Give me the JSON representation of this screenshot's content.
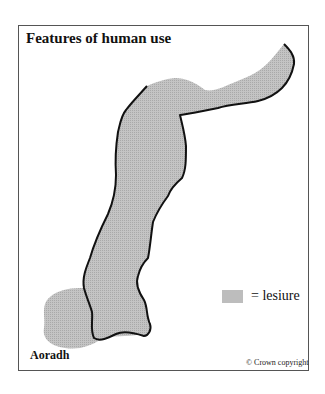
{
  "title": "Features of human use",
  "legend": {
    "symbol": "=",
    "label": "lesiure",
    "swatch_color": "#bdbdbd"
  },
  "place_label": "Aoradh",
  "copyright": "© Crown copyright",
  "colors": {
    "fill": "#bdbdbd",
    "outline": "#111111",
    "frame": "#555555"
  },
  "legend_text": "= lesiure"
}
